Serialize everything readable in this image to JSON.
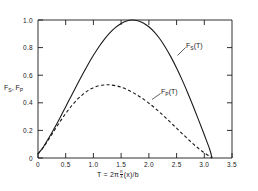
{
  "chart_data": {
    "type": "line",
    "title": "",
    "xlabel": "T = 2π (n/λ)(x)/b",
    "xlabel_parts": {
      "prefix": "T = 2π",
      "frac_num": "n",
      "frac_den": "λ",
      "suffix": "(x)/b"
    },
    "ylabel": "F_S, F_P",
    "ylabel_parts": [
      "F",
      "S",
      ", F",
      "P"
    ],
    "xlim": [
      0,
      3.5
    ],
    "ylim": [
      0,
      1.0
    ],
    "xticks": [
      0,
      0.5,
      1.0,
      1.5,
      2.0,
      2.5,
      3.0,
      3.5
    ],
    "xtick_labels": [
      "0",
      "0.5",
      "1.0",
      "1.5",
      "2.0",
      "2.5",
      "3.0",
      "3.5"
    ],
    "yticks": [
      0,
      0.2,
      0.4,
      0.6,
      0.8,
      1.0
    ],
    "ytick_labels": [
      "0",
      "0.2",
      "0.4",
      "0.6",
      "0.8",
      "1.0"
    ],
    "grid": false,
    "legend_position": "inline-annotations",
    "series": [
      {
        "name": "F_S(T)",
        "label": "F_S(T)",
        "label_parts": {
          "pre": "F",
          "sub": "S",
          "post": "(T)"
        },
        "style": "solid",
        "color": "#1a1a1a",
        "annotation_x": 2.55,
        "annotation_y": 0.8,
        "peak_x": 1.6,
        "peak_y": 1.0,
        "zero_crossings": [
          0.0,
          3.14
        ],
        "x": [
          0.0,
          0.05,
          0.1,
          0.2,
          0.3,
          0.4,
          0.5,
          0.6,
          0.7,
          0.8,
          0.9,
          1.0,
          1.1,
          1.2,
          1.3,
          1.4,
          1.5,
          1.6,
          1.7,
          1.8,
          1.9,
          2.0,
          2.1,
          2.2,
          2.3,
          2.4,
          2.5,
          2.6,
          2.7,
          2.8,
          2.9,
          3.0,
          3.1,
          3.14
        ],
        "y": [
          0.03,
          0.055,
          0.082,
          0.148,
          0.219,
          0.294,
          0.372,
          0.45,
          0.527,
          0.603,
          0.676,
          0.744,
          0.806,
          0.861,
          0.908,
          0.946,
          0.975,
          0.993,
          1.0,
          0.995,
          0.979,
          0.951,
          0.912,
          0.862,
          0.801,
          0.731,
          0.652,
          0.566,
          0.473,
          0.375,
          0.273,
          0.168,
          0.06,
          0.0
        ]
      },
      {
        "name": "F_P(T)",
        "label": "F_P(T)",
        "label_parts": {
          "pre": "F",
          "sub": "P",
          "post": "(T)"
        },
        "style": "dashed",
        "color": "#1a1a1a",
        "annotation_x": 2.15,
        "annotation_y": 0.455,
        "peak_x": 1.25,
        "peak_y": 0.53,
        "zero_crossings": [
          0.0,
          3.14
        ],
        "x": [
          0.0,
          0.05,
          0.1,
          0.2,
          0.3,
          0.4,
          0.5,
          0.6,
          0.7,
          0.8,
          0.9,
          1.0,
          1.1,
          1.2,
          1.25,
          1.3,
          1.4,
          1.5,
          1.6,
          1.7,
          1.8,
          1.9,
          2.0,
          2.1,
          2.2,
          2.3,
          2.4,
          2.5,
          2.6,
          2.7,
          2.8,
          2.9,
          3.0,
          3.1,
          3.14
        ],
        "y": [
          0.03,
          0.054,
          0.079,
          0.14,
          0.203,
          0.265,
          0.323,
          0.375,
          0.42,
          0.458,
          0.488,
          0.51,
          0.524,
          0.53,
          0.531,
          0.53,
          0.524,
          0.513,
          0.497,
          0.477,
          0.453,
          0.427,
          0.397,
          0.365,
          0.33,
          0.293,
          0.255,
          0.216,
          0.177,
          0.139,
          0.102,
          0.068,
          0.038,
          0.011,
          0.0
        ]
      }
    ]
  }
}
